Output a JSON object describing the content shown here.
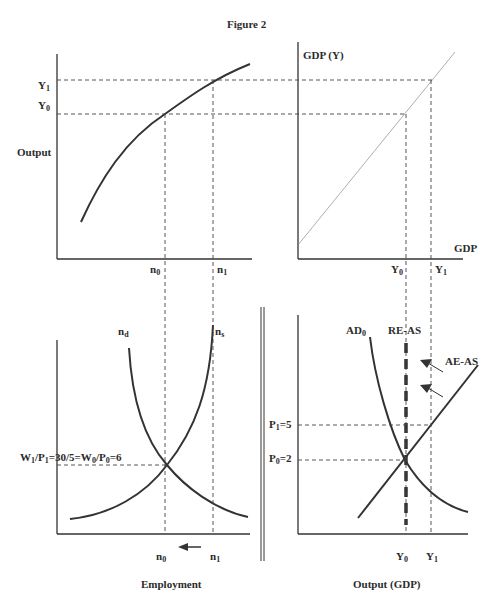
{
  "figure": {
    "title": "Figure 2",
    "panels": {
      "production_function": {
        "y_axis_label": "Output",
        "y_ticks": [
          "Y1",
          "Y0"
        ],
        "x_ticks": [
          "n0",
          "n1"
        ]
      },
      "gdp_identity": {
        "y_axis_label": "GDP (Y)",
        "x_axis_label": "GDP",
        "x_ticks": [
          "Y0",
          "Y1"
        ]
      },
      "labor_market": {
        "curves": [
          "nd",
          "ns"
        ],
        "wage_label": "W1/P1=30/5=W0/P0=6",
        "x_ticks": [
          "n0",
          "n1"
        ],
        "arrow_direction": "left",
        "caption": "Employment"
      },
      "ad_as": {
        "curves": [
          "AD0",
          "RE-AS",
          "AE-AS"
        ],
        "y_ticks": [
          "P1=5",
          "P0=2"
        ],
        "x_ticks": [
          "Y0",
          "Y1"
        ],
        "caption": "Output  (GDP)"
      }
    }
  },
  "text": {
    "title": "Figure 2",
    "output": "Output",
    "y1_main": "Y",
    "y1_sub": "1",
    "y0_main": "Y",
    "y0_sub": "0",
    "n": "n",
    "sub0": "0",
    "sub1": "1",
    "gdp_y": "GDP (Y)",
    "gdp": "GDP",
    "nd_sub": "d",
    "ns_sub": "s",
    "w1": "W",
    "p1": "/P",
    "wage_mid": "=30/5=W",
    "wage_end": "=6",
    "ad": "AD",
    "re_as": "RE-AS",
    "ae_as": "AE-AS",
    "p1_label": "P",
    "p1_val": "=5",
    "p0_val": "=2",
    "employment": "Employment",
    "output_gdp": "Output  (GDP)"
  }
}
